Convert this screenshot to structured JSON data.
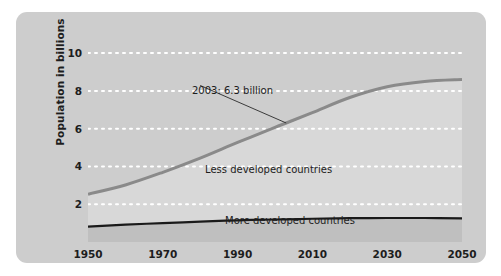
{
  "chart_data": {
    "type": "area",
    "title": "",
    "subtitle": "",
    "xlabel": "",
    "ylabel": "Population in billions",
    "xlim": [
      1950,
      2050
    ],
    "ylim": [
      0,
      10.8
    ],
    "grid": true,
    "grid_style": "dotted-white-horizontal",
    "legend": "inline-labels",
    "x_ticks": [
      {
        "value": 1950,
        "label": "1950"
      },
      {
        "value": 1970,
        "label": "1970"
      },
      {
        "value": 1990,
        "label": "1990"
      },
      {
        "value": 2010,
        "label": "2010"
      },
      {
        "value": 2030,
        "label": "2030"
      },
      {
        "value": 2050,
        "label": "2050"
      }
    ],
    "y_ticks": [
      {
        "value": 2,
        "label": "2"
      },
      {
        "value": 4,
        "label": "4"
      },
      {
        "value": 6,
        "label": "6"
      },
      {
        "value": 8,
        "label": "8"
      },
      {
        "value": 10,
        "label": "10"
      }
    ],
    "x": [
      1950,
      1960,
      1970,
      1980,
      1990,
      2000,
      2003,
      2010,
      2020,
      2030,
      2040,
      2050
    ],
    "series": [
      {
        "name": "World total (top of stack)",
        "label": "Less developed countries",
        "color": "#8a8a8a",
        "fill": "#d8d8d8",
        "line_width": 3,
        "values": [
          2.53,
          3.02,
          3.69,
          4.44,
          5.27,
          6.07,
          6.3,
          6.85,
          7.65,
          8.22,
          8.5,
          8.6
        ]
      },
      {
        "name": "More developed countries",
        "label": "More developed countries",
        "color": "#1a1a1a",
        "fill": "#bfbfbf",
        "line_width": 2.2,
        "values": [
          0.81,
          0.92,
          1.0,
          1.08,
          1.15,
          1.19,
          1.2,
          1.23,
          1.26,
          1.27,
          1.27,
          1.25
        ]
      }
    ],
    "annotations": [
      {
        "text": "2003: 6.3 billion",
        "x": 2003,
        "y": 6.3,
        "label_x": 1980,
        "label_y": 8.5,
        "leader_line": true
      }
    ]
  },
  "series_labels": {
    "less_developed": "Less developed countries",
    "more_developed": "More developed countries"
  },
  "axis": {
    "y_title": "Population in billions"
  },
  "annotation": {
    "text": "2003: 6.3 billion"
  },
  "colors": {
    "panel_background": "#cdcdcd",
    "plot_upper_fill": "#d8d8d8",
    "plot_lower_fill": "#bfbfbf",
    "total_line": "#8a8a8a",
    "developed_line": "#1a1a1a",
    "gridline": "#ffffff",
    "text": "#1d1d1d"
  }
}
